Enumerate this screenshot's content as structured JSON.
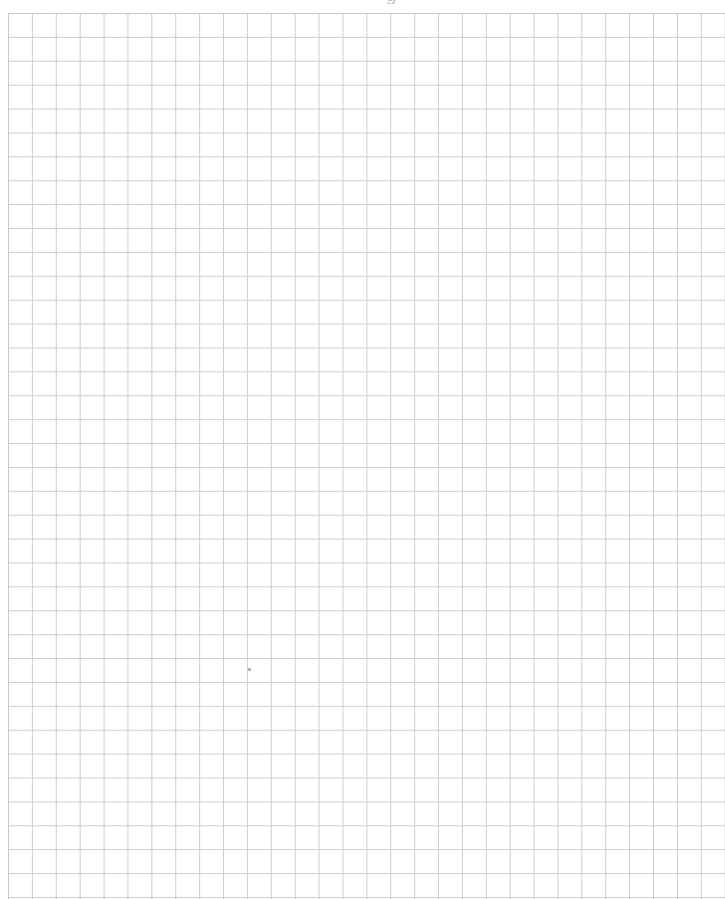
{
  "document": {
    "type": "graph-paper",
    "title_fragment": "g",
    "grid": {
      "columns": 30,
      "rows": 37,
      "cell_size_px": 24,
      "origin_px": [
        8,
        13
      ],
      "line_color": "#cdcdcd",
      "background_color": "#ffffff"
    },
    "marks": [
      {
        "type": "speck",
        "x": 249,
        "y": 669,
        "color": "#a8a8a8"
      }
    ]
  }
}
